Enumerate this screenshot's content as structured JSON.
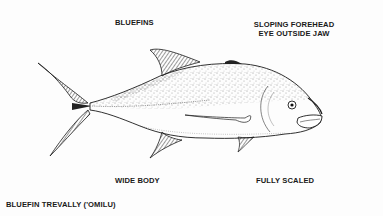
{
  "diagram": {
    "title": "BLUEFIN TREVALLY ('OMILU)",
    "labels": {
      "top_left": "BLUEFINS",
      "top_right_line1": "SLOPING FOREHEAD",
      "top_right_line2": "EYE OUTSIDE JAW",
      "bottom_left": "WIDE BODY",
      "bottom_right": "FULLY SCALED"
    },
    "colors": {
      "background": "#fdfdfd",
      "ink": "#1a1a1a",
      "stipple": "#333333"
    }
  }
}
